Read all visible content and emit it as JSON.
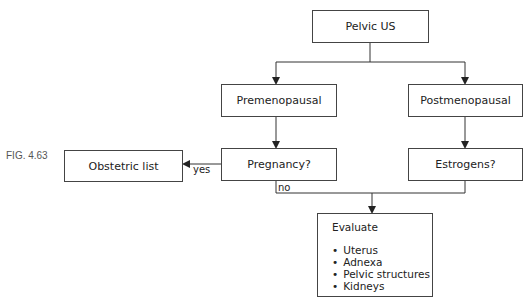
{
  "figure_label": "FIG. 4.63",
  "nodes": {
    "root": "Pelvic US",
    "premenopausal": "Premenopausal",
    "postmenopausal": "Postmenopausal",
    "pregnancy": "Pregnancy?",
    "estrogens": "Estrogens?",
    "obstetric": "Obstetric list",
    "evaluate": {
      "title": "Evaluate",
      "items": [
        "Uterus",
        "Adnexa",
        "Pelvic structures",
        "Kidneys"
      ]
    }
  },
  "edge_labels": {
    "yes": "yes",
    "no": "no"
  },
  "colors": {
    "line": "#333333",
    "border": "#444444",
    "background": "#ffffff"
  }
}
